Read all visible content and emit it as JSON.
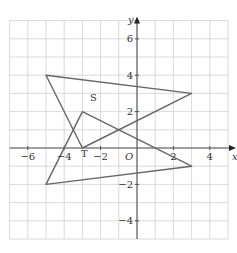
{
  "diagram": {
    "type": "coordinate-plane",
    "x_axis": {
      "label": "x",
      "min": -7,
      "max": 5,
      "ticks": [
        -6,
        -4,
        -2,
        2,
        4
      ],
      "tick_labels": [
        "−6",
        "−4",
        "−2",
        "2",
        "4"
      ]
    },
    "y_axis": {
      "label": "y",
      "min": -5,
      "max": 7,
      "ticks": [
        6,
        4,
        2,
        -2,
        -4
      ],
      "tick_labels": [
        "6",
        "4",
        "2",
        "−2",
        "−4"
      ]
    },
    "origin_label": "O",
    "grid": true,
    "colors": {
      "grid": "#d0d0d0",
      "axis": "#555555",
      "shape": "#666666"
    },
    "shapes": [
      {
        "name": "S",
        "label": "S",
        "vertices": [
          [
            -5,
            4
          ],
          [
            3,
            3
          ],
          [
            -3,
            0
          ]
        ],
        "label_pos": [
          -2.4,
          2.6
        ]
      },
      {
        "name": "T",
        "label": "T",
        "vertices": [
          [
            -3,
            2
          ],
          [
            3,
            -1
          ],
          [
            -5,
            -2
          ]
        ],
        "label_pos": [
          -2.9,
          -0.5
        ]
      }
    ]
  }
}
